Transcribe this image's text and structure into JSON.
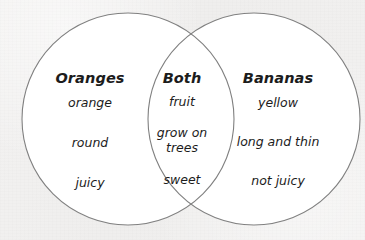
{
  "diagram": {
    "type": "venn-2-set",
    "background_color": "#f1f0ef",
    "circle_fill": "#ffffff",
    "circle_stroke": "#808080",
    "text_color": "#1c1c1c",
    "left_set": {
      "heading": "Oranges",
      "items": [
        "orange",
        "round",
        "juicy"
      ]
    },
    "intersection_set": {
      "heading": "Both",
      "items": [
        "fruit",
        "grow on trees",
        "sweet"
      ]
    },
    "right_set": {
      "heading": "Bananas",
      "items": [
        "yellow",
        "long and thin",
        "not juicy"
      ]
    }
  }
}
